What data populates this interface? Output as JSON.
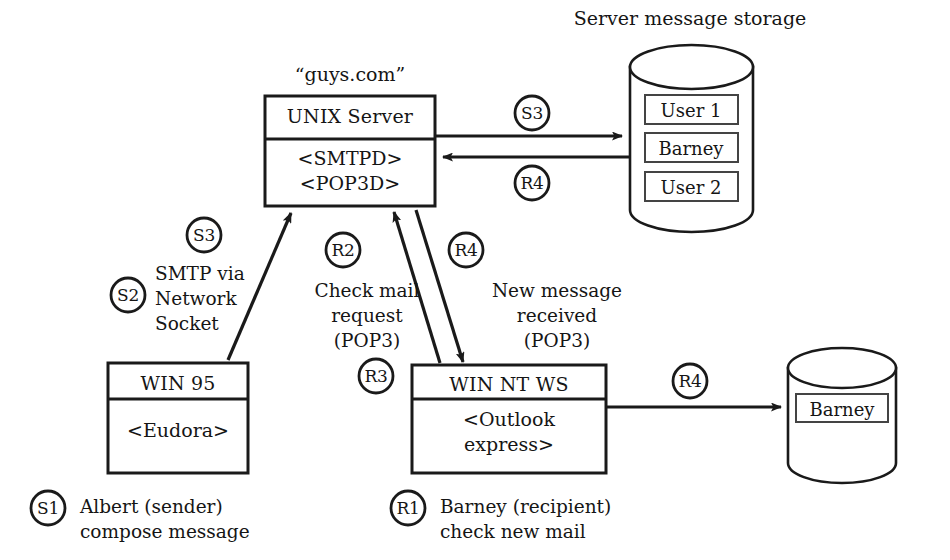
{
  "diagram": {
    "title_storage": "Server message storage",
    "server_domain": "“guys.com”",
    "colors": {
      "stroke": "#1a1a1a",
      "background": "#ffffff",
      "text": "#151515"
    },
    "nodes": {
      "unix_server": {
        "title": "UNIX Server",
        "body_line1": "<SMTPD>",
        "body_line2": "<POP3D>",
        "caption": "“guys.com”"
      },
      "win95": {
        "title": "WIN 95",
        "body_line1": "<Eudora>"
      },
      "winnt": {
        "title": "WIN NT WS",
        "body_line1": "<Outlook",
        "body_line2": "express>"
      },
      "server_storage": {
        "caption": "Server message storage",
        "slots": [
          "User 1",
          "Barney",
          "User 2"
        ]
      },
      "client_storage": {
        "slots": [
          "Barney"
        ]
      }
    },
    "badges": {
      "s1": "S1",
      "s2": "S2",
      "s3_left": "S3",
      "s3_top": "S3",
      "r1": "R1",
      "r2": "R2",
      "r3": "R3",
      "r4_top": "R4",
      "r4_mid": "R4",
      "r4_right": "R4"
    },
    "edge_labels": {
      "smtp_via_network_socket": {
        "line1": "SMTP via",
        "line2": "Network",
        "line3": "Socket"
      },
      "check_mail_request": {
        "line1": "Check mail",
        "line2": "request",
        "line3": "(POP3)"
      },
      "new_message_received": {
        "line1": "New message",
        "line2": "received",
        "line3": "(POP3)"
      }
    },
    "footnotes": {
      "sender": {
        "line1": "Albert (sender)",
        "line2": "compose message"
      },
      "recipient": {
        "line1": "Barney (recipient)",
        "line2": "check new mail"
      }
    }
  }
}
